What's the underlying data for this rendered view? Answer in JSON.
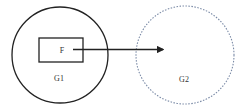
{
  "diagram": {
    "nodes": [
      {
        "id": "G1",
        "label": "G1",
        "shape": "circle",
        "border": "solid",
        "color": "#222222"
      },
      {
        "id": "G2",
        "label": "G2",
        "shape": "circle",
        "border": "dotted",
        "color": "#7a8aa6"
      },
      {
        "id": "F",
        "label": "F",
        "shape": "rectangle",
        "parent": "G1",
        "color": "#222222"
      }
    ],
    "edges": [
      {
        "from": "F",
        "to": "G2",
        "style": "arrow",
        "color": "#222222"
      }
    ]
  }
}
